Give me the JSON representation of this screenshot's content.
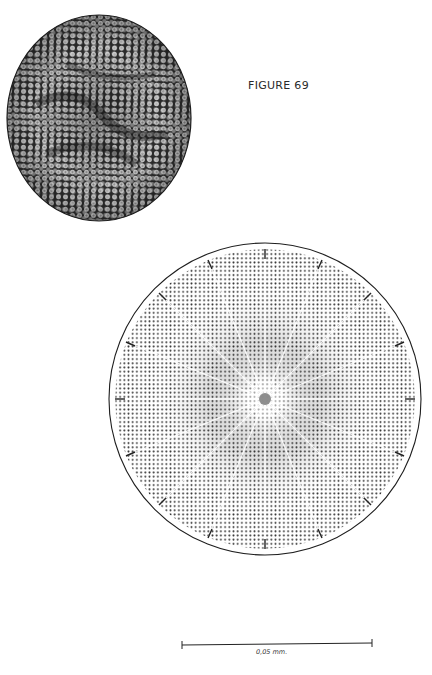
{
  "figure": {
    "title": "FIGURE 69",
    "panels": [
      {
        "name": "photomicrograph",
        "description": "circular valve with hexagonal areolae"
      },
      {
        "name": "line-drawing",
        "description": "circular valve with radial rows of areolae and marginal spines"
      }
    ],
    "scale_bar": {
      "label": "0,05 mm."
    },
    "colors": {
      "background": "#ffffff",
      "ink": "#1a1a1a",
      "photo_dark": "#2b2b2b",
      "photo_light": "#d9d9d9"
    }
  }
}
